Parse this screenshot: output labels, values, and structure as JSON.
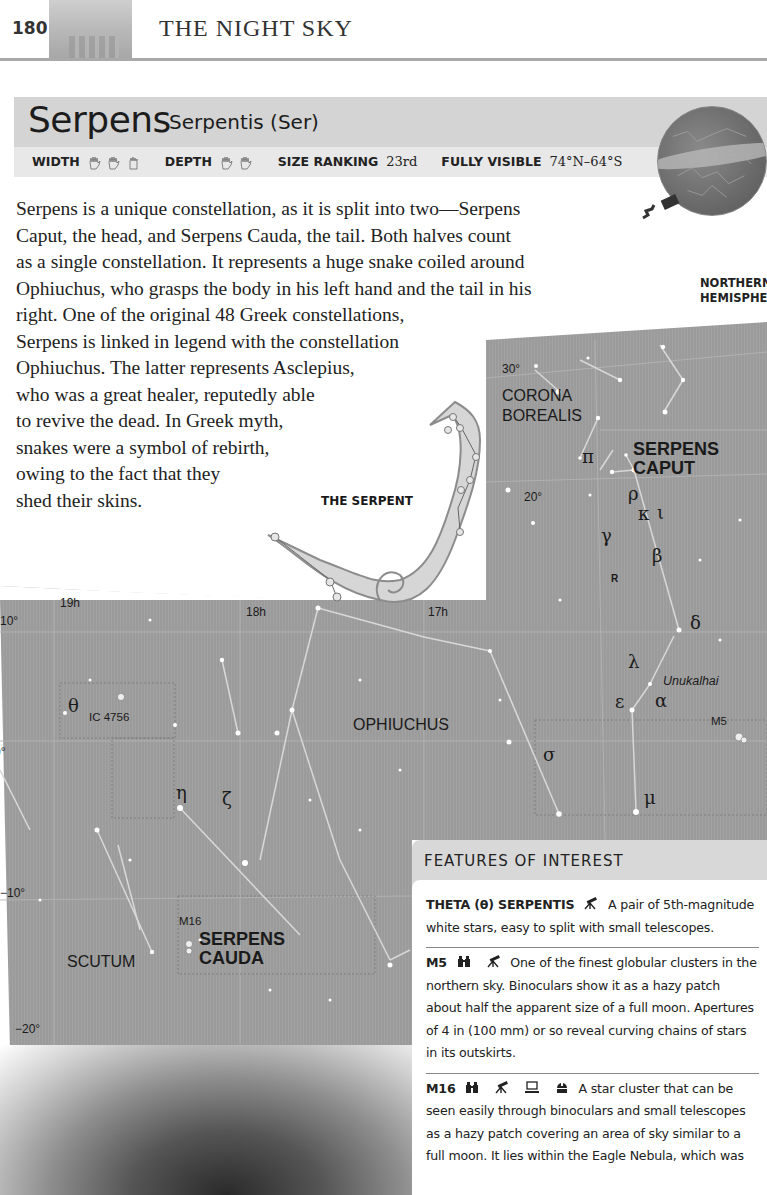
{
  "running_header": {
    "page_number": "180",
    "section_title": "THE NIGHT SKY"
  },
  "title": {
    "name": "Serpens",
    "genitive": "Serpentis (Ser)"
  },
  "stats": {
    "width_label": "WIDTH",
    "width_hands": 3,
    "depth_label": "DEPTH",
    "depth_hands": 2,
    "size_ranking_label": "SIZE RANKING",
    "size_ranking_value": "23rd",
    "fully_visible_label": "FULLY VISIBLE",
    "fully_visible_value": "74°N–64°S"
  },
  "globe": {
    "caption_line1": "NORTHERN",
    "caption_line2": "HEMISPHERE"
  },
  "body_text": {
    "lines": [
      "Serpens is a unique constellation, as it is split into two—Serpens",
      "Caput, the head, and Serpens Cauda, the tail. Both halves count",
      "as a single constellation. It represents a huge snake coiled around",
      "Ophiuchus, who grasps the body in his left hand and the tail in his",
      "right. One of the original 48 Greek constellations,",
      "Serpens is linked in legend with the constellation",
      "Ophiuchus. The latter represents Asclepius,",
      "who was a great healer, reputedly able",
      "to revive the dead. In Greek myth,",
      "snakes were a symbol of rebirth,",
      "owing to the fact that they",
      "shed their skins."
    ]
  },
  "illustration": {
    "caption": "THE SERPENT"
  },
  "star_map": {
    "coords": {
      "dec_30": "30°",
      "dec_20": "20°",
      "dec_10": "10°",
      "dec_0": "0°",
      "dec_m10": "−10°",
      "dec_m20": "−20°",
      "ra_19h": "19h",
      "ra_18h": "18h",
      "ra_17h": "17h"
    },
    "constellations": {
      "corona_borealis_1": "CORONA",
      "corona_borealis_2": "BOREALIS",
      "serpens_caput_1": "SERPENS",
      "serpens_caput_2": "CAPUT",
      "ophiuchus": "OPHIUCHUS",
      "scutum": "SCUTUM",
      "serpens_cauda_1": "SERPENS",
      "serpens_cauda_2": "CAUDA"
    },
    "stars": {
      "pi": "π",
      "rho": "ρ",
      "kappa": "κ",
      "iota": "ι",
      "gamma": "γ",
      "beta": "β",
      "r": "R",
      "delta": "δ",
      "lambda": "λ",
      "epsilon": "ε",
      "alpha": "α",
      "alpha_name": "Unukalhai",
      "sigma": "σ",
      "mu": "μ",
      "theta": "θ",
      "eta": "η",
      "zeta": "ζ"
    },
    "deep_sky": {
      "ic4756": "IC 4756",
      "m5": "M5",
      "m16": "M16"
    }
  },
  "features": {
    "heading": "FEATURES OF INTEREST",
    "items": [
      {
        "name": "THETA (θ) SERPENTIS",
        "equipment": [
          "telescope-icon"
        ],
        "text": "A pair of 5th-magnitude white stars, easy to split with small telescopes."
      },
      {
        "name": "M5",
        "equipment": [
          "binoculars-icon",
          "telescope-icon"
        ],
        "text": "One of the finest globular clusters in the northern sky. Binoculars show it as a hazy patch about half the apparent size of a full moon. Apertures of 4 in (100 mm) or so reveal curving chains of stars in its outskirts."
      },
      {
        "name": "M16",
        "equipment": [
          "binoculars-icon",
          "telescope-icon",
          "camera-icon",
          "observatory-icon"
        ],
        "text": "A star cluster that can be seen easily through binoculars and small telescopes as a hazy patch covering an area of sky similar to a full moon. It lies within the Eagle Nebula, which was"
      }
    ]
  },
  "colors": {
    "title_band": "#d4d4d4",
    "stats_band": "#e8e8e8",
    "map_bg": "#9c9c9c",
    "features_header": "#d8d8d8",
    "rule": "#a9a9a9"
  }
}
